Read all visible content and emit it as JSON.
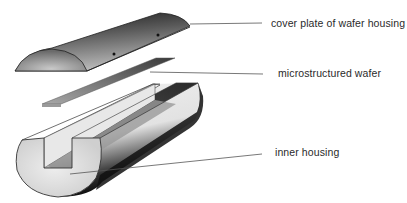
{
  "diagram": {
    "type": "exploded-view",
    "components": [
      {
        "id": "cover",
        "label": "cover plate of wafer housing"
      },
      {
        "id": "wafer",
        "label": "microstructured wafer"
      },
      {
        "id": "inner",
        "label": "inner housing"
      }
    ]
  },
  "colors": {
    "background": "#ffffff",
    "line": "#555555",
    "text": "#2a2a2a",
    "shade_dark": "#1a1a1a",
    "shade_mid": "#8a8a8a",
    "shade_light": "#e6e6e6"
  }
}
